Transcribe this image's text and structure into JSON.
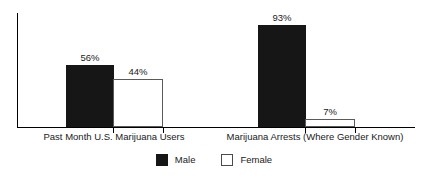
{
  "chart_data": {
    "type": "bar",
    "title": "",
    "subtitle": "",
    "xlabel": "",
    "ylabel": "",
    "ylim": [
      0,
      100
    ],
    "grid": false,
    "legend_position": "bottom-center",
    "value_suffix": "%",
    "categories": [
      "Past Month U.S. Marijuana Users",
      "Marijuana Arrests (Where Gender Known)"
    ],
    "series": [
      {
        "name": "Male",
        "color": "#161616",
        "values": [
          56,
          44
        ],
        "labels": [
          "56%",
          "44%"
        ]
      },
      {
        "name": "Female",
        "color": "#ffffff",
        "values": [
          44,
          7
        ],
        "labels": [
          "44%",
          "7%"
        ]
      }
    ],
    "bars": [
      {
        "group": 0,
        "series": "Male",
        "value": 56,
        "label": "56%"
      },
      {
        "group": 0,
        "series": "Female",
        "value": 44,
        "label": "44%"
      },
      {
        "group": 1,
        "series": "Male",
        "value": 93,
        "label": "93%"
      },
      {
        "group": 1,
        "series": "Female",
        "value": 7,
        "label": "7%"
      }
    ]
  },
  "legend": {
    "items": [
      {
        "label": "Male",
        "swatch": "filled-square-icon"
      },
      {
        "label": "Female",
        "swatch": "outlined-square-icon"
      }
    ]
  },
  "axis": {
    "y_line": "vertical-axis-line",
    "x_line": "horizontal-axis-line"
  }
}
